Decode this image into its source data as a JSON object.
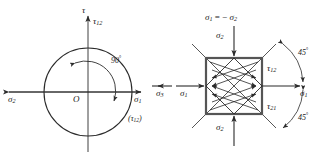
{
  "figure": {
    "stroke_color": "#2b2b2b",
    "axis_color": "#555555",
    "text_color": "#1a1a1a"
  },
  "mohr": {
    "name": "mohr-circle-diagram",
    "axis_vertical_label": "τ",
    "axis_right_label": "σ",
    "axis_right_sub": "1",
    "axis_left_label": "σ",
    "axis_left_sub": "2",
    "origin_label": "O",
    "top_point_label": "τ",
    "top_point_sub": "12",
    "paren_label": "(τ",
    "paren_sub": "12",
    "paren_close": ")",
    "angle_label": "90",
    "angle_degree_symbol": "°",
    "center": [
      88,
      92
    ],
    "radius": 44
  },
  "element": {
    "name": "stress-element-diagram",
    "top_relation_sigma": "σ",
    "top_relation_sub1": "1",
    "top_relation_equals": " = − ",
    "top_relation_sigma2": "σ",
    "top_relation_sub2": "2",
    "top_label": "σ",
    "top_sub": "2",
    "bottom_label": "σ",
    "bottom_sub": "2",
    "left_label": "σ",
    "left_sub": "1",
    "left_outer_label": "σ",
    "left_outer_sub": "3",
    "right_label": "σ",
    "right_sub": "1",
    "tau_upper_label": "τ",
    "tau_upper_sub": "12",
    "tau_lower_label": "τ",
    "tau_lower_sub": "21",
    "angle_upper_label": "45",
    "angle_upper_degree": "°",
    "angle_lower_label": "45",
    "angle_lower_degree": "°",
    "square": {
      "x": 206,
      "y": 58,
      "size": 56
    }
  }
}
